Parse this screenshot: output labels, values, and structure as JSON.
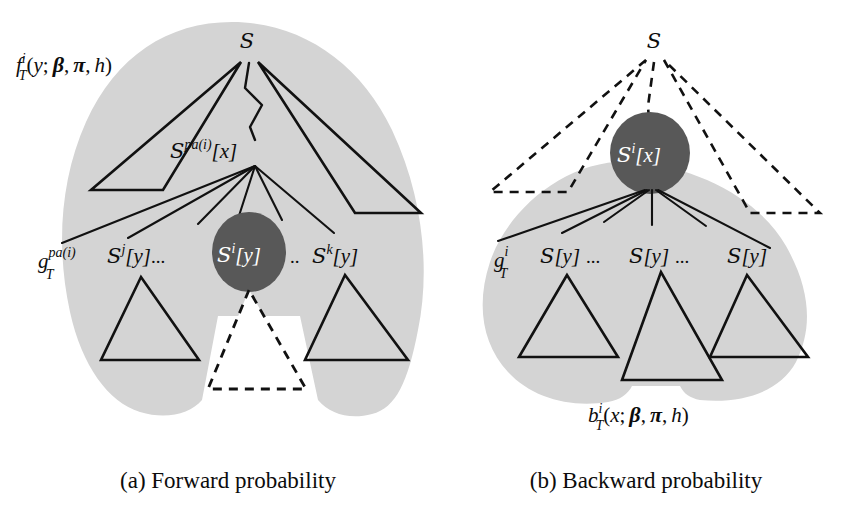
{
  "figure": {
    "background_color": "#ffffff",
    "blob_color": "#d4d4d4",
    "node_color": "#585858",
    "line_color": "#111111"
  },
  "panel_a": {
    "id": "panel-a",
    "caption": "(a) Forward probability",
    "formula": {
      "base": "f",
      "sub": "T",
      "sup": "i",
      "args_open": "(",
      "arg_var": "y",
      "semicolon": ";",
      "beta": "β",
      "comma1": ",",
      "pi": "π",
      "comma2": ",",
      "h": "h",
      "args_close": ")",
      "full": "f_T^i(y; β, π, h)"
    },
    "root_label": "S",
    "parent_node": {
      "base": "S",
      "sup": "pa(i)",
      "bracket": "[x]",
      "full": "S^{pa(i)}[x]"
    },
    "g_label": {
      "base": "g",
      "sub": "T",
      "sup": "pa(i)",
      "full": "g_T^{pa(i)}"
    },
    "children": [
      {
        "base": "S",
        "sup": "j",
        "bracket": "[y]",
        "full": "S^j[y]",
        "trailing": "..."
      },
      {
        "base": "S",
        "sup": "i",
        "bracket": "[y]",
        "full": "S^i[y]",
        "trailing": "..",
        "highlighted": true
      },
      {
        "base": "S",
        "sup": "k",
        "bracket": "[y]",
        "full": "S^k[y]",
        "trailing": ""
      }
    ]
  },
  "panel_b": {
    "id": "panel-b",
    "caption": "(b) Backward probability",
    "formula": {
      "base": "b",
      "sub": "T",
      "sup": "i",
      "args_open": "(",
      "arg_var": "x",
      "semicolon": ";",
      "beta": "β",
      "comma1": ",",
      "pi": "π",
      "comma2": ",",
      "h": "h",
      "args_close": ")",
      "full": "b_T^i(x; β, π, h)"
    },
    "root_label": "S",
    "focus_node": {
      "base": "S",
      "sup": "i",
      "bracket": "[x]",
      "full": "S^i[x]",
      "highlighted": true
    },
    "g_label": {
      "base": "g",
      "sub": "T",
      "sup": "i",
      "full": "g_T^i"
    },
    "children": [
      {
        "base": "S",
        "sup": "",
        "bracket": "[y]",
        "full": "S[y]",
        "trailing": "..."
      },
      {
        "base": "S",
        "sup": "",
        "bracket": "[y]",
        "full": "S[y]",
        "trailing": "..."
      },
      {
        "base": "S",
        "sup": "",
        "bracket": "[y]",
        "full": "S[y]",
        "trailing": ""
      }
    ]
  }
}
